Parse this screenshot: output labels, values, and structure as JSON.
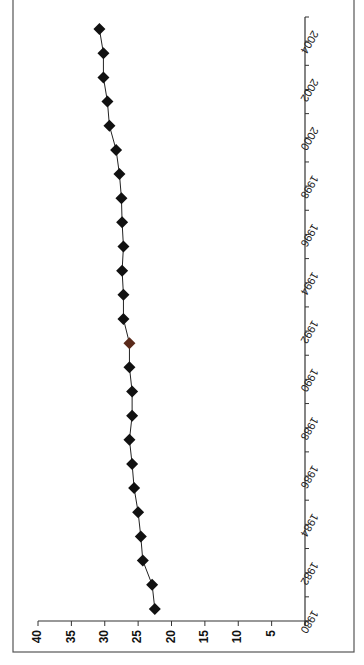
{
  "chart_data": {
    "type": "line",
    "orientation": "rotated-90-clockwise (value axis horizontal, time axis vertical)",
    "title": "",
    "xlabel": "Year",
    "ylabel": "",
    "ylim": [
      0,
      40
    ],
    "y_ticks": [
      5,
      10,
      15,
      20,
      25,
      30,
      35,
      40
    ],
    "x": [
      1980,
      1981,
      1982,
      1983,
      1984,
      1985,
      1986,
      1987,
      1988,
      1989,
      1990,
      1991,
      1992,
      1993,
      1994,
      1995,
      1996,
      1997,
      1998,
      1999,
      2000,
      2001,
      2002,
      2003,
      2004
    ],
    "x_tick_labels": [
      "1980",
      "1982",
      "1984",
      "1986",
      "1988",
      "1990",
      "1992",
      "1994",
      "1996",
      "1998",
      "2000",
      "2002",
      "2004"
    ],
    "series": [
      {
        "name": "per capita (pounds)",
        "marker": "diamond",
        "color": "#111111",
        "values": [
          22.5,
          22.9,
          24.3,
          24.6,
          25.0,
          25.6,
          25.9,
          26.3,
          25.9,
          25.9,
          26.3,
          26.3,
          27.2,
          27.2,
          27.4,
          27.2,
          27.4,
          27.5,
          27.8,
          28.3,
          29.3,
          29.6,
          30.2,
          30.2,
          30.8
        ]
      }
    ],
    "grid": false,
    "legend": "none"
  },
  "layout": {
    "frame": {
      "left": 13,
      "top": -2,
      "right": 354,
      "bottom": 652
    },
    "plot": {
      "value_zero_x": 305,
      "value_40_x": 38,
      "axis_top_y": 17,
      "axis_bottom_y": 621
    }
  },
  "colors": {
    "axis": "#333333",
    "marker": "#111111",
    "highlight_marker": "#5a2a1a",
    "frame": "#555555"
  }
}
